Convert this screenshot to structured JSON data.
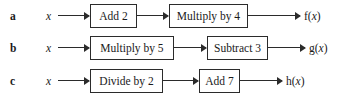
{
  "diagram": {
    "type": "function-machine-flowchart",
    "background_color": "#ffffff",
    "line_color": "#2b2b2b",
    "rows": [
      {
        "label": "a",
        "input": "x",
        "steps": [
          "Add 2",
          "Multiply by 4"
        ],
        "output_name": "f",
        "output_open_paren": "(",
        "output_var": "x",
        "output_close_paren": ")",
        "output": "f(x)"
      },
      {
        "label": "b",
        "input": "x",
        "steps": [
          "Multiply by 5",
          "Subtract 3"
        ],
        "output_name": "g",
        "output_open_paren": "(",
        "output_var": "x",
        "output_close_paren": ")",
        "output": "g(x)"
      },
      {
        "label": "c",
        "input": "x",
        "steps": [
          "Divide by 2",
          "Add 7"
        ],
        "output_name": "h",
        "output_open_paren": "(",
        "output_var": "x",
        "output_close_paren": ")",
        "output": "h(x)"
      }
    ]
  }
}
